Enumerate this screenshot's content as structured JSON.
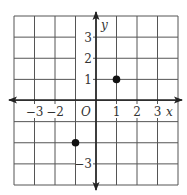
{
  "chart_data": {
    "type": "scatter",
    "title": "",
    "xlabel": "x",
    "ylabel": "y",
    "origin_label": "O",
    "xlim": [
      -4,
      4
    ],
    "ylim": [
      -4,
      4
    ],
    "grid": true,
    "x_tick_labels": [
      {
        "value": -3,
        "label": "−3"
      },
      {
        "value": -2,
        "label": "−2"
      },
      {
        "value": 1,
        "label": "1"
      },
      {
        "value": 2,
        "label": "2"
      },
      {
        "value": 3,
        "label": "3"
      }
    ],
    "y_tick_labels": [
      {
        "value": 3,
        "label": "3"
      },
      {
        "value": 2,
        "label": "2"
      },
      {
        "value": 1,
        "label": "1"
      },
      {
        "value": -3,
        "label": "−3"
      }
    ],
    "points": [
      {
        "x": 1,
        "y": 1
      },
      {
        "x": -1,
        "y": -2
      }
    ],
    "colors": {
      "grid": "#555555",
      "axis": "#222222",
      "point": "#111111",
      "text": "#333333"
    }
  }
}
